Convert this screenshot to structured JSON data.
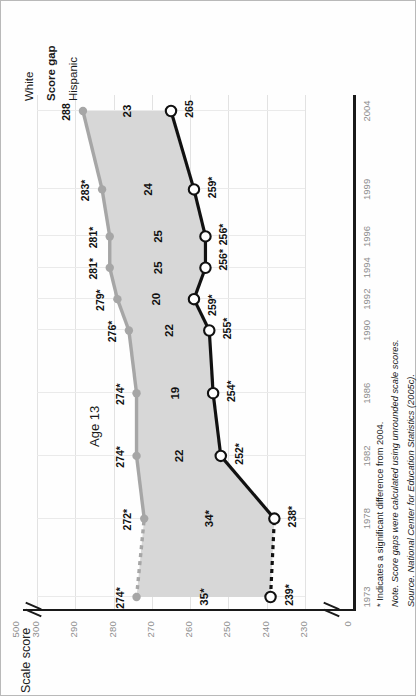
{
  "figure": {
    "chart_title": "Age 13",
    "y_axis_title": "Scale score"
  },
  "legend": [
    {
      "key": "white",
      "label": "White",
      "bold": false,
      "color": "#a6a6a6"
    },
    {
      "key": "gap",
      "label": "Score gap",
      "bold": true,
      "color": "#111111"
    },
    {
      "key": "hispanic",
      "label": "Hispanic",
      "bold": false,
      "color": "#111111"
    }
  ],
  "notes": [
    "* Indicates a significant difference from 2004.",
    "Note. Score gaps were calculated using unrounded scale scores.",
    "Source. National Center for Education Statistics (2005c)."
  ],
  "colors": {
    "white_series": "#a6a6a6",
    "hispanic_series": "#111111",
    "gap_fill": "#d7d7d7",
    "gridline": "#e2e2e2",
    "axis": "#1a1a1a",
    "tick_text": "#8d8d8d"
  },
  "chart_data": {
    "type": "line",
    "title": "Age 13",
    "xlabel": "",
    "ylabel": "Scale score",
    "grid": true,
    "legend_position": "top-right",
    "x": [
      1973,
      1978,
      1982,
      1986,
      1990,
      1992,
      1994,
      1996,
      1999,
      2004
    ],
    "categories": [
      "1973",
      "1978",
      "1982",
      "1986",
      "1990",
      "1992",
      "1994",
      "1996",
      "1999",
      "2004"
    ],
    "ylim": [
      230,
      300
    ],
    "yticks": [
      "500",
      "300",
      "290",
      "280",
      "270",
      "260",
      "250",
      "240",
      "230",
      "0"
    ],
    "axis_breaks": [
      "between 500 and 300",
      "between 230 and 0"
    ],
    "series": [
      {
        "name": "White",
        "color": "#a6a6a6",
        "marker": "filled-circle",
        "dashed_segments": [
          [
            1973,
            1978
          ]
        ],
        "values": [
          274,
          272,
          274,
          274,
          276,
          279,
          281,
          281,
          283,
          288
        ],
        "labels": [
          "274*",
          "272*",
          "274*",
          "274*",
          "276*",
          "279*",
          "281*",
          "281*",
          "283*",
          "288"
        ]
      },
      {
        "name": "Hispanic",
        "color": "#111111",
        "marker": "open-circle",
        "dashed_segments": [
          [
            1973,
            1978
          ]
        ],
        "values": [
          239,
          238,
          252,
          254,
          255,
          259,
          256,
          256,
          259,
          265
        ],
        "labels": [
          "239*",
          "238*",
          "252*",
          "254*",
          "255*",
          "259*",
          "256*",
          "256*",
          "259*",
          "265"
        ]
      }
    ],
    "gap_series": {
      "name": "Score gap",
      "values": [
        35,
        34,
        22,
        19,
        22,
        20,
        25,
        25,
        24,
        23
      ],
      "labels": [
        "35*",
        "34*",
        "22",
        "19",
        "22",
        "20",
        "25",
        "25",
        "24",
        "23"
      ],
      "fill_color": "#d7d7d7"
    }
  }
}
